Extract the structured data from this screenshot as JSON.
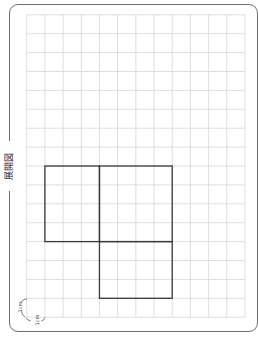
{
  "page": {
    "title": "展開図"
  },
  "grid": {
    "columns": 12,
    "rows": 16,
    "cell_unit": "1cm",
    "line_color": "#d6d6d6"
  },
  "net": {
    "stroke_color": "#3a3a3a",
    "faces": [
      {
        "col": 1,
        "row": 8,
        "width": 3,
        "height": 4
      },
      {
        "col": 4,
        "row": 8,
        "width": 4,
        "height": 4
      },
      {
        "col": 4,
        "row": 12,
        "width": 4,
        "height": 3
      }
    ]
  },
  "scale": {
    "vertical_label": "1cm",
    "horizontal_label": "1cm"
  },
  "colors": {
    "frame": "#6e6e6e",
    "title": "#333333"
  }
}
